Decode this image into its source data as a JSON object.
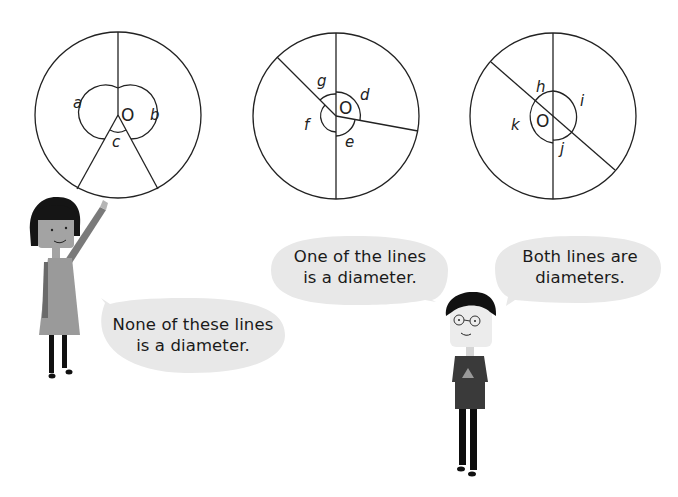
{
  "diagrams": [
    {
      "id": "circle-1",
      "center_label": "O",
      "angle_labels": [
        "a",
        "b",
        "c"
      ],
      "description": "Three radii from centre O, none forming a diameter"
    },
    {
      "id": "circle-2",
      "center_label": "O",
      "angle_labels": [
        "d",
        "e",
        "f",
        "g"
      ],
      "description": "One vertical diameter and two radii"
    },
    {
      "id": "circle-3",
      "center_label": "O",
      "angle_labels": [
        "h",
        "i",
        "j",
        "k"
      ],
      "description": "Two intersecting diameters"
    }
  ],
  "speech_bubbles": {
    "girl": {
      "line1": "None of these lines",
      "line2": "is a diameter."
    },
    "boy_left": {
      "line1": "One of the lines",
      "line2": "is a diameter."
    },
    "boy_right": {
      "line1": "Both lines are",
      "line2": "diameters."
    }
  },
  "colors": {
    "line": "#222222",
    "bubble_fill": "#e8e8e8",
    "figure_dark": "#1a1a1a",
    "figure_grey": "#8a8a8a",
    "skin": "#a8a8a8"
  }
}
